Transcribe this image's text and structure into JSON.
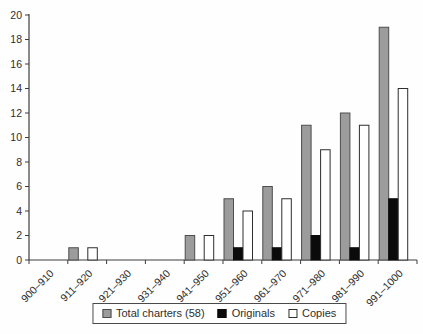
{
  "chart_data": {
    "type": "bar",
    "title": "",
    "xlabel": "",
    "ylabel": "",
    "categories": [
      "900–910",
      "911–920",
      "921–930",
      "931–940",
      "941–950",
      "951–960",
      "961–970",
      "971–980",
      "981–990",
      "991–1000"
    ],
    "series": [
      {
        "name": "Total charters (58)",
        "fill": "#9c9c9c",
        "stroke": "#4d4d4d",
        "values": [
          0,
          1,
          0,
          0,
          2,
          5,
          6,
          11,
          12,
          19
        ]
      },
      {
        "name": "Originals",
        "fill": "#0b0b0b",
        "stroke": "#0b0b0b",
        "values": [
          0,
          0,
          0,
          0,
          0,
          1,
          1,
          2,
          1,
          5
        ]
      },
      {
        "name": "Copies",
        "fill": "#ffffff",
        "stroke": "#2e2e2e",
        "values": [
          0,
          1,
          0,
          0,
          2,
          4,
          5,
          9,
          11,
          14
        ]
      }
    ],
    "ylim": [
      0,
      20
    ],
    "ytick_step": 2,
    "yticks": [
      0,
      2,
      4,
      6,
      8,
      10,
      12,
      14,
      16,
      18,
      20
    ],
    "grid": false,
    "legend_position": "bottom-center",
    "x_label_rotation_deg": -45,
    "axis_color": "#3c3c3c",
    "text_color": "#2e2e2e",
    "background_color": "#fefefe"
  }
}
